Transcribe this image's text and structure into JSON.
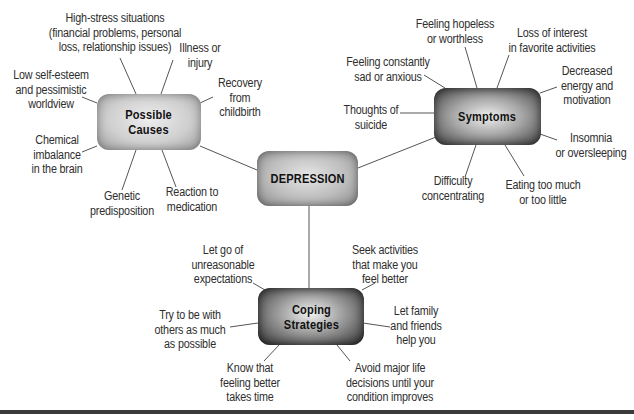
{
  "diagram": {
    "type": "concept-map",
    "center": {
      "label": "DEPRESSION"
    },
    "branches": {
      "causes": {
        "label": "Possible\nCauses",
        "items": [
          "High-stress situations\n(financial problems, personal\nloss, relationship issues)",
          "Illness or\ninjury",
          "Recovery\nfrom\nchildbirth",
          "Low self-esteem\nand pessimistic\nworldview",
          "Chemical\nimbalance\nin the brain",
          "Genetic\npredisposition",
          "Reaction to\nmedication"
        ]
      },
      "symptoms": {
        "label": "Symptoms",
        "items": [
          "Feeling hopeless\nor worthless",
          "Loss of interest\nin favorite activities",
          "Feeling constantly\nsad or anxious",
          "Decreased\nenergy and\nmotivation",
          "Thoughts of\nsuicide",
          "Insomnia\nor oversleeping",
          "Difficulty\nconcentrating",
          "Eating too much\nor too little"
        ]
      },
      "coping": {
        "label": "Coping\nStrategies",
        "items": [
          "Let go of\nunreasonable\nexpectations",
          "Seek activities\nthat make you\nfeel better",
          "Try to be with\nothers as much\nas possible",
          "Let family\nand friends\nhelp you",
          "Know that\nfeeling better\ntakes time",
          "Avoid major life\ndecisions until your\ncondition improves"
        ]
      }
    },
    "colors": {
      "line": "#555555",
      "text": "#2e2e2e",
      "rule": "#3a3a3a"
    }
  }
}
